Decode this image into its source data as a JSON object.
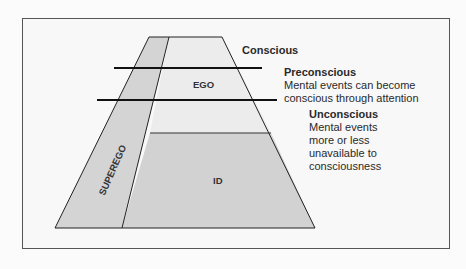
{
  "diagram": {
    "title": "",
    "regions": {
      "ego": "EGO",
      "id": "ID",
      "superego": "SUPEREGO"
    },
    "levels": {
      "conscious": {
        "title": "Conscious"
      },
      "preconscious": {
        "title": "Preconscious",
        "desc_line1": "Mental events can become",
        "desc_line2": "conscious through attention"
      },
      "unconscious": {
        "title": "Unconscious",
        "desc_line1": "Mental events",
        "desc_line2": "more or less",
        "desc_line3": "unavailable to",
        "desc_line4": "consciousness"
      }
    },
    "colors": {
      "upper_fill": "#ececec",
      "lower_fill": "#d2d2d2",
      "superego_fill": "#d4d4d4",
      "line": "#222222"
    }
  }
}
